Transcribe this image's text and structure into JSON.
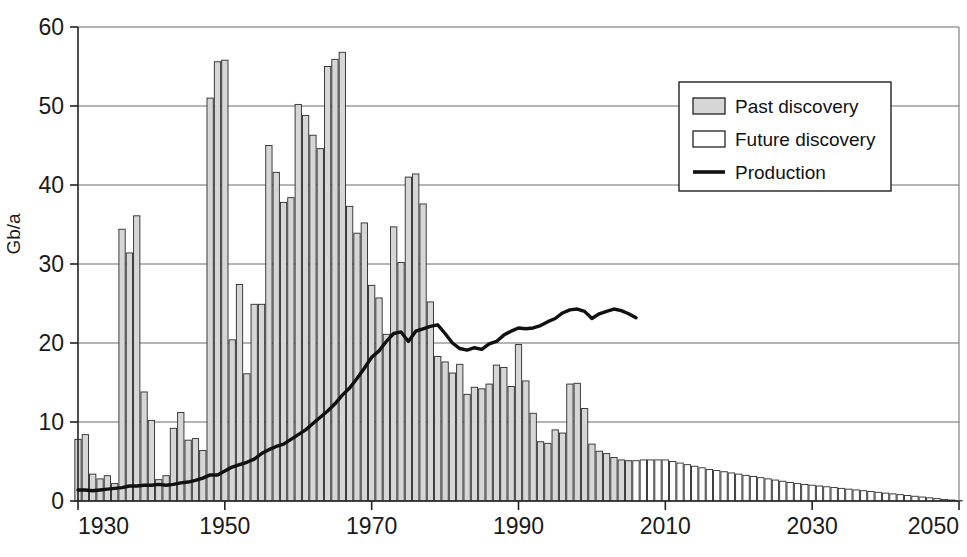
{
  "chart_data": {
    "type": "bar",
    "title": "",
    "subtitle": "",
    "xlabel": "",
    "ylabel": "Gb/a",
    "xlim": [
      1930,
      2050
    ],
    "ylim": [
      0,
      60
    ],
    "ytick_labels": [
      "0",
      "10",
      "20",
      "30",
      "40",
      "50",
      "60"
    ],
    "yticks": [
      0,
      10,
      20,
      30,
      40,
      50,
      60
    ],
    "xtick_labels": [
      "1930",
      "1950",
      "1970",
      "1990",
      "2010",
      "2030",
      "2050"
    ],
    "xticks": [
      1930,
      1950,
      1970,
      1990,
      2010,
      2030,
      2050
    ],
    "grid": "horizontal",
    "legend_position": "top-right",
    "legend": [
      {
        "label": "Past discovery",
        "marker": "filled-box",
        "color": "#d6d6d6"
      },
      {
        "label": "Future discovery",
        "marker": "empty-box",
        "color": "#ffffff"
      },
      {
        "label": "Production",
        "marker": "line",
        "color": "#111111"
      }
    ],
    "series": [
      {
        "name": "Past discovery",
        "type": "bar",
        "color": "#d6d6d6",
        "x": [
          1930,
          1931,
          1932,
          1933,
          1934,
          1935,
          1936,
          1937,
          1938,
          1939,
          1940,
          1941,
          1942,
          1943,
          1944,
          1945,
          1946,
          1947,
          1948,
          1949,
          1950,
          1951,
          1952,
          1953,
          1954,
          1955,
          1956,
          1957,
          1958,
          1959,
          1960,
          1961,
          1962,
          1963,
          1964,
          1965,
          1966,
          1967,
          1968,
          1969,
          1970,
          1971,
          1972,
          1973,
          1974,
          1975,
          1976,
          1977,
          1978,
          1979,
          1980,
          1981,
          1982,
          1983,
          1984,
          1985,
          1986,
          1987,
          1988,
          1989,
          1990,
          1991,
          1992,
          1993,
          1994,
          1995,
          1996,
          1997,
          1998,
          1999,
          2000,
          2001,
          2002,
          2003,
          2004,
          2005
        ],
        "values": [
          7.8,
          8.4,
          3.4,
          2.8,
          3.2,
          2.2,
          34.4,
          31.4,
          36.1,
          13.8,
          10.2,
          2.7,
          3.2,
          9.2,
          11.2,
          7.7,
          7.9,
          6.4,
          51.0,
          55.6,
          55.8,
          20.4,
          27.4,
          16.1,
          24.9,
          24.9,
          45.0,
          41.6,
          37.8,
          38.4,
          50.2,
          48.8,
          46.3,
          44.6,
          55.0,
          55.9,
          56.8,
          37.3,
          33.9,
          35.2,
          27.3,
          25.7,
          21.1,
          34.7,
          30.2,
          41.0,
          41.4,
          37.6,
          25.2,
          18.3,
          17.6,
          16.2,
          17.3,
          13.5,
          14.4,
          14.2,
          14.8,
          17.2,
          16.9,
          14.5,
          19.8,
          15.2,
          11.1,
          7.5,
          7.3,
          9.0,
          8.6,
          14.8,
          14.9,
          11.7,
          7.2,
          6.3,
          6.0,
          5.5,
          5.2,
          5.1
        ]
      },
      {
        "name": "Future discovery",
        "type": "bar",
        "color": "#ffffff",
        "x": [
          2006,
          2007,
          2008,
          2009,
          2010,
          2011,
          2012,
          2013,
          2014,
          2015,
          2016,
          2017,
          2018,
          2019,
          2020,
          2021,
          2022,
          2023,
          2024,
          2025,
          2026,
          2027,
          2028,
          2029,
          2030,
          2031,
          2032,
          2033,
          2034,
          2035,
          2036,
          2037,
          2038,
          2039,
          2040,
          2041,
          2042,
          2043,
          2044,
          2045,
          2046,
          2047,
          2048,
          2049,
          2050
        ],
        "values": [
          5.1,
          5.2,
          5.2,
          5.2,
          5.2,
          5.0,
          4.8,
          4.6,
          4.4,
          4.2,
          4.0,
          3.85,
          3.7,
          3.55,
          3.4,
          3.25,
          3.1,
          2.95,
          2.8,
          2.65,
          2.5,
          2.35,
          2.2,
          2.1,
          2.0,
          1.9,
          1.8,
          1.7,
          1.6,
          1.5,
          1.4,
          1.3,
          1.2,
          1.1,
          1.0,
          0.9,
          0.8,
          0.7,
          0.6,
          0.5,
          0.4,
          0.3,
          0.2,
          0.12,
          0.05
        ]
      },
      {
        "name": "Production",
        "type": "line",
        "color": "#111111",
        "x": [
          1930,
          1931,
          1932,
          1933,
          1934,
          1935,
          1936,
          1937,
          1938,
          1939,
          1940,
          1941,
          1942,
          1943,
          1944,
          1945,
          1946,
          1947,
          1948,
          1949,
          1950,
          1951,
          1952,
          1953,
          1954,
          1955,
          1956,
          1957,
          1958,
          1959,
          1960,
          1961,
          1962,
          1963,
          1964,
          1965,
          1966,
          1967,
          1968,
          1969,
          1970,
          1971,
          1972,
          1973,
          1974,
          1975,
          1976,
          1977,
          1978,
          1979,
          1980,
          1981,
          1982,
          1983,
          1984,
          1985,
          1986,
          1987,
          1988,
          1989,
          1990,
          1991,
          1992,
          1993,
          1994,
          1995,
          1996,
          1997,
          1998,
          1999,
          2000,
          2001,
          2002,
          2003,
          2004,
          2005,
          2006
        ],
        "values": [
          1.4,
          1.4,
          1.3,
          1.4,
          1.5,
          1.6,
          1.7,
          1.9,
          1.9,
          2.0,
          2.0,
          2.1,
          2.0,
          2.1,
          2.3,
          2.4,
          2.6,
          2.9,
          3.3,
          3.3,
          3.8,
          4.3,
          4.6,
          4.9,
          5.3,
          6.0,
          6.5,
          6.9,
          7.2,
          7.8,
          8.4,
          9.0,
          9.8,
          10.6,
          11.4,
          12.3,
          13.4,
          14.3,
          15.5,
          16.8,
          18.2,
          19.0,
          20.2,
          21.2,
          21.4,
          20.2,
          21.5,
          21.8,
          22.1,
          22.3,
          21.2,
          20.0,
          19.3,
          19.1,
          19.4,
          19.2,
          19.9,
          20.2,
          21.0,
          21.5,
          21.9,
          21.8,
          21.9,
          22.2,
          22.7,
          23.1,
          23.8,
          24.2,
          24.3,
          24.0,
          23.1,
          23.7,
          24.0,
          24.3,
          24.1,
          23.7,
          23.2
        ]
      }
    ]
  }
}
